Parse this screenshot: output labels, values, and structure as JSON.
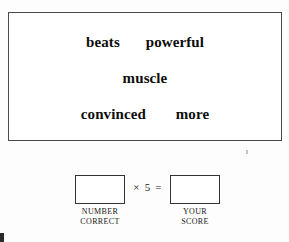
{
  "page": {
    "background_color": "#fdfdfd",
    "ink_color": "#111111"
  },
  "word_panel": {
    "border_color": "#4a4a4a",
    "rows": [
      {
        "words": [
          "beats",
          "powerful"
        ]
      },
      {
        "words": [
          "muscle"
        ]
      },
      {
        "words": [
          "convinced",
          "more"
        ]
      }
    ]
  },
  "score_section": {
    "operator": "× 5 =",
    "number_correct": {
      "value": "",
      "label_line1": "NUMBER",
      "label_line2": "CORRECT"
    },
    "your_score": {
      "value": "",
      "label_line1": "YOUR",
      "label_line2": "SCORE"
    }
  },
  "artifacts": {
    "speck": "scan-speck",
    "corner": "corner-mark"
  }
}
